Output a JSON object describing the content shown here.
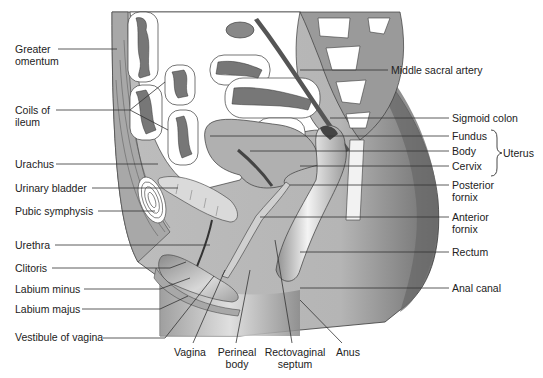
{
  "figure": {
    "colors": {
      "tissue": "#b8b8b8",
      "tissue_light": "#d4d4d4",
      "tissue_dark": "#7a7a7a",
      "outline": "#3a3a3a",
      "background": "#ffffff",
      "leader": "#333333"
    }
  },
  "labels_left": [
    {
      "id": "greater-omentum",
      "line1": "Greater",
      "line2": "omentum"
    },
    {
      "id": "coils-of-ileum",
      "line1": "Coils of",
      "line2": "ileum"
    },
    {
      "id": "urachus",
      "text": "Urachus"
    },
    {
      "id": "urinary-bladder",
      "text": "Urinary bladder"
    },
    {
      "id": "pubic-symphysis",
      "text": "Pubic symphysis"
    },
    {
      "id": "urethra",
      "text": "Urethra"
    },
    {
      "id": "clitoris",
      "text": "Clitoris"
    },
    {
      "id": "labium-minus",
      "text": "Labium minus"
    },
    {
      "id": "labium-majus",
      "text": "Labium majus"
    },
    {
      "id": "vestibule-of-vagina",
      "text": "Vestibule of vagina"
    }
  ],
  "labels_right": [
    {
      "id": "middle-sacral-artery",
      "text": "Middle sacral artery"
    },
    {
      "id": "sigmoid-colon",
      "text": "Sigmoid colon"
    },
    {
      "id": "fundus",
      "text": "Fundus"
    },
    {
      "id": "body",
      "text": "Body"
    },
    {
      "id": "cervix",
      "text": "Cervix"
    },
    {
      "id": "uterus",
      "text": "Uterus"
    },
    {
      "id": "posterior-fornix",
      "line1": "Posterior",
      "line2": "fornix"
    },
    {
      "id": "anterior-fornix",
      "line1": "Anterior",
      "line2": "fornix"
    },
    {
      "id": "rectum",
      "text": "Rectum"
    },
    {
      "id": "anal-canal",
      "text": "Anal canal"
    }
  ],
  "labels_bottom": [
    {
      "id": "vagina",
      "text": "Vagina"
    },
    {
      "id": "perineal-body",
      "line1": "Perineal",
      "line2": "body"
    },
    {
      "id": "rectovaginal-septum",
      "line1": "Rectovaginal",
      "line2": "septum"
    },
    {
      "id": "anus",
      "text": "Anus"
    }
  ]
}
